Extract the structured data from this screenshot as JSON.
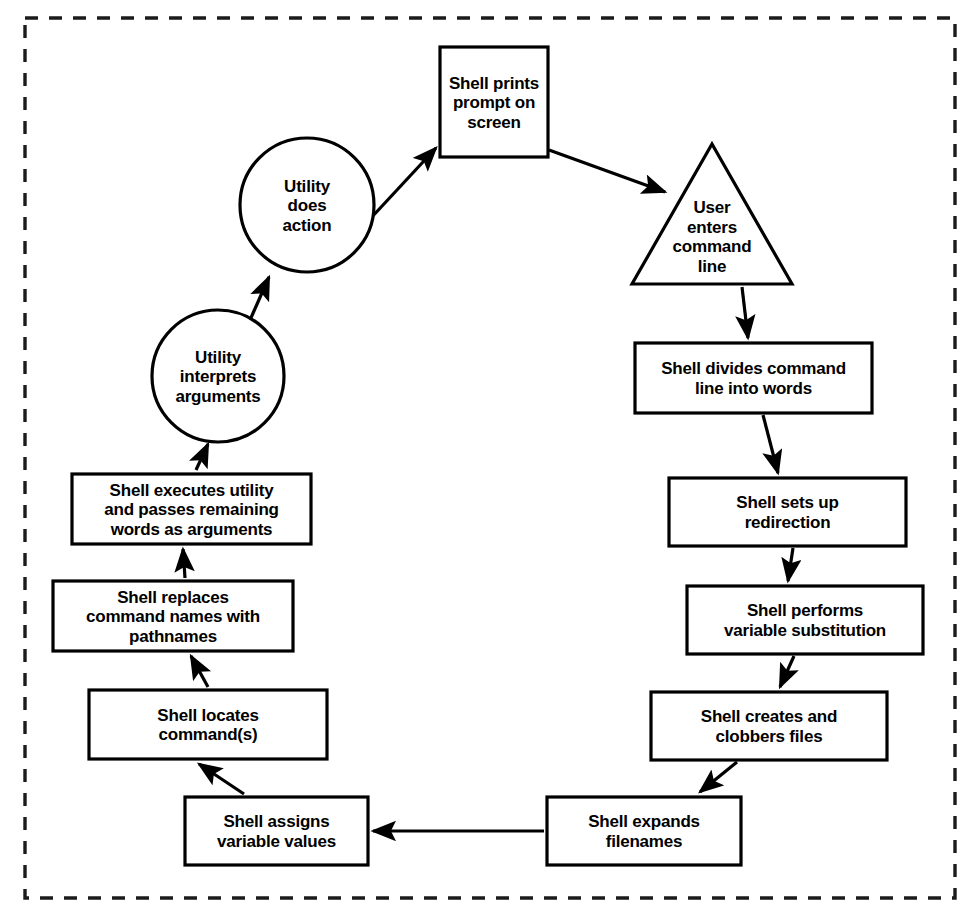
{
  "diagram": {
    "frame": {
      "style": "dashed",
      "color": "#1b1b1b",
      "x": 25,
      "y": 18,
      "width": 930,
      "height": 880
    },
    "colors": {
      "stroke": "#000000",
      "fill": "#ffffff",
      "background": "#ffffff",
      "frame": "#1b1b1b"
    },
    "nodes": [
      {
        "id": "shell-prints-prompt",
        "shape": "rect",
        "lines": [
          "Shell prints",
          "prompt on",
          "screen"
        ],
        "bold": false,
        "x": 440,
        "y": 47,
        "w": 108,
        "h": 110
      },
      {
        "id": "user-enters-command-line",
        "shape": "triangle",
        "lines": [
          "User",
          "enters",
          "command",
          "line"
        ],
        "bold": false,
        "x": 632,
        "y": 144,
        "w": 160,
        "h": 140
      },
      {
        "id": "shell-divides-command-line",
        "shape": "rect",
        "lines": [
          "Shell divides command",
          "line into words"
        ],
        "bold": false,
        "x": 635,
        "y": 343,
        "w": 237,
        "h": 70
      },
      {
        "id": "shell-sets-up-redirection",
        "shape": "rect",
        "lines": [
          "Shell sets up",
          "redirection"
        ],
        "bold": false,
        "x": 669,
        "y": 478,
        "w": 237,
        "h": 68
      },
      {
        "id": "shell-performs-variable-substitution",
        "shape": "rect",
        "lines": [
          "Shell performs",
          "variable substitution"
        ],
        "bold": false,
        "x": 687,
        "y": 586,
        "w": 236,
        "h": 68
      },
      {
        "id": "shell-creates-clobbers-files",
        "shape": "rect",
        "lines": [
          "Shell creates and",
          "clobbers files"
        ],
        "bold": false,
        "x": 651,
        "y": 692,
        "w": 236,
        "h": 68
      },
      {
        "id": "shell-expands-filenames",
        "shape": "rect",
        "lines": [
          "Shell expands",
          "filenames"
        ],
        "bold": false,
        "x": 547,
        "y": 797,
        "w": 194,
        "h": 68
      },
      {
        "id": "shell-assigns-variable-values",
        "shape": "rect",
        "lines": [
          "Shell assigns",
          "variable values"
        ],
        "bold": true,
        "x": 185,
        "y": 797,
        "w": 183,
        "h": 68
      },
      {
        "id": "shell-locates-commands",
        "shape": "rect",
        "lines": [
          "Shell locates",
          "command(s)"
        ],
        "bold": false,
        "x": 89,
        "y": 690,
        "w": 238,
        "h": 69
      },
      {
        "id": "shell-replaces-command-names",
        "shape": "rect",
        "lines": [
          "Shell replaces",
          "command names with",
          "pathnames"
        ],
        "bold": false,
        "x": 53,
        "y": 581,
        "w": 240,
        "h": 70
      },
      {
        "id": "shell-executes-utility",
        "shape": "rect",
        "lines": [
          "Shell executes utility",
          "and passes remaining",
          "words as arguments"
        ],
        "bold": false,
        "x": 72,
        "y": 474,
        "w": 239,
        "h": 70
      },
      {
        "id": "utility-interprets-arguments",
        "shape": "circle",
        "lines": [
          "Utility",
          "interprets",
          "arguments"
        ],
        "bold": false,
        "cx": 218,
        "cy": 376,
        "r": 66
      },
      {
        "id": "utility-does-action",
        "shape": "circle",
        "lines": [
          "Utility",
          "does",
          "action"
        ],
        "bold": false,
        "cx": 307,
        "cy": 205,
        "r": 67
      }
    ],
    "edges": [
      {
        "id": "edge-prompt-to-user",
        "from": "shell-prints-prompt",
        "to": "user-enters-command-line",
        "x1": 549,
        "y1": 150,
        "x2": 665,
        "y2": 192
      },
      {
        "id": "edge-user-to-divides",
        "from": "user-enters-command-line",
        "to": "shell-divides-command-line",
        "x1": 742,
        "y1": 287,
        "x2": 748,
        "y2": 338
      },
      {
        "id": "edge-divides-to-redirection",
        "from": "shell-divides-command-line",
        "to": "shell-sets-up-redirection",
        "x1": 763,
        "y1": 415,
        "x2": 778,
        "y2": 473
      },
      {
        "id": "edge-redirection-to-substitution",
        "from": "shell-sets-up-redirection",
        "to": "shell-performs-variable-substitution",
        "x1": 793,
        "y1": 548,
        "x2": 788,
        "y2": 581
      },
      {
        "id": "edge-substitution-to-clobbers",
        "from": "shell-performs-variable-substitution",
        "to": "shell-creates-clobbers-files",
        "x1": 794,
        "y1": 656,
        "x2": 780,
        "y2": 687
      },
      {
        "id": "edge-clobbers-to-expands",
        "from": "shell-creates-clobbers-files",
        "to": "shell-expands-filenames",
        "x1": 737,
        "y1": 762,
        "x2": 700,
        "y2": 792
      },
      {
        "id": "edge-expands-to-assigns",
        "from": "shell-expands-filenames",
        "to": "shell-assigns-variable-values",
        "x1": 544,
        "y1": 831,
        "x2": 373,
        "y2": 831
      },
      {
        "id": "edge-assigns-to-locates",
        "from": "shell-assigns-variable-values",
        "to": "shell-locates-commands",
        "x1": 244,
        "y1": 794,
        "x2": 199,
        "y2": 764
      },
      {
        "id": "edge-locates-to-replaces",
        "from": "shell-locates-commands",
        "to": "shell-replaces-command-names",
        "x1": 208,
        "y1": 687,
        "x2": 191,
        "y2": 656
      },
      {
        "id": "edge-replaces-to-executes",
        "from": "shell-replaces-command-names",
        "to": "shell-executes-utility",
        "x1": 185,
        "y1": 578,
        "x2": 183,
        "y2": 549
      },
      {
        "id": "edge-executes-to-interprets",
        "from": "shell-executes-utility",
        "to": "utility-interprets-arguments",
        "x1": 196,
        "y1": 470,
        "x2": 208,
        "y2": 444
      },
      {
        "id": "edge-interprets-to-action",
        "from": "utility-interprets-arguments",
        "to": "utility-does-action",
        "x1": 250,
        "y1": 320,
        "x2": 269,
        "y2": 277
      },
      {
        "id": "edge-action-to-prompt",
        "from": "utility-does-action",
        "to": "shell-prints-prompt",
        "x1": 357,
        "y1": 233,
        "x2": 436,
        "y2": 148
      }
    ]
  }
}
